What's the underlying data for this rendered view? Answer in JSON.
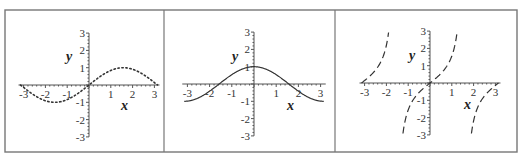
{
  "figure": {
    "frame": {
      "x": 5,
      "y": 10,
      "width": 512,
      "height": 142,
      "color": "#777777"
    },
    "dividers": [
      164,
      335
    ]
  },
  "chart_data": [
    {
      "type": "line",
      "function": "sin(x)",
      "line_style": "dotted",
      "color": "#333333",
      "xlabel": "x",
      "ylabel": "y",
      "xlim": [
        -3.14159,
        3.14159
      ],
      "ylim": [
        -3,
        3
      ],
      "x_ticks": [
        -3,
        -2,
        -1,
        1,
        2,
        3
      ],
      "y_ticks": [
        -3,
        -2,
        -1,
        1,
        2,
        3
      ],
      "grid": false,
      "x": [
        -3.14,
        -2.5,
        -2,
        -1.57,
        -1,
        -0.5,
        0,
        0.5,
        1,
        1.57,
        2,
        2.5,
        3.14
      ],
      "values": [
        0,
        -0.6,
        -0.91,
        -1,
        -0.84,
        -0.48,
        0,
        0.48,
        0.84,
        1,
        0.91,
        0.6,
        0
      ],
      "layout": {
        "origin": [
          89,
          85
        ],
        "xscale": 21.8,
        "yscale": 17.3,
        "xlabel_pos": [
          121,
          110
        ],
        "ylabel_pos": [
          66,
          61
        ]
      }
    },
    {
      "type": "line",
      "function": "cos(x)",
      "line_style": "solid",
      "color": "#333333",
      "xlabel": "x",
      "ylabel": "y",
      "xlim": [
        -3.14159,
        3.14159
      ],
      "ylim": [
        -3,
        3
      ],
      "x_ticks": [
        -3,
        -2,
        -1,
        1,
        2,
        3
      ],
      "y_ticks": [
        -3,
        -2,
        -1,
        1,
        2,
        3
      ],
      "grid": false,
      "x": [
        -3.14,
        -2.5,
        -2,
        -1.57,
        -1,
        -0.5,
        0,
        0.5,
        1,
        1.57,
        2,
        2.5,
        3.14
      ],
      "values": [
        -1,
        -0.8,
        -0.42,
        0,
        0.54,
        0.88,
        1,
        0.88,
        0.54,
        0,
        -0.42,
        -0.8,
        -1
      ],
      "layout": {
        "origin": [
          254,
          84
        ],
        "xscale": 22.2,
        "yscale": 17.3,
        "xlabel_pos": [
          287,
          110
        ],
        "ylabel_pos": [
          232,
          61
        ]
      }
    },
    {
      "type": "line",
      "function": "tan(x)",
      "line_style": "dashed",
      "color": "#333333",
      "xlabel": "x",
      "ylabel": "y",
      "xlim": [
        -3.14159,
        3.14159
      ],
      "ylim": [
        -3,
        3
      ],
      "x_ticks": [
        -3,
        -2,
        -1,
        1,
        2,
        3
      ],
      "y_ticks": [
        -3,
        -2,
        -1,
        1,
        2,
        3
      ],
      "grid": false,
      "x": [
        -3.14,
        -2.5,
        -1.89,
        -1.25,
        -1,
        -0.5,
        0,
        0.5,
        1,
        1.25,
        1.89,
        2.5,
        3.14
      ],
      "values": [
        0,
        0.75,
        3,
        -3,
        -1.56,
        -0.55,
        0,
        0.55,
        1.56,
        3,
        -3,
        -0.75,
        0
      ],
      "layout": {
        "origin": [
          430,
          83
        ],
        "xscale": 21.8,
        "yscale": 17.3,
        "xlabel_pos": [
          464,
          109
        ],
        "ylabel_pos": [
          409,
          60
        ]
      }
    }
  ]
}
